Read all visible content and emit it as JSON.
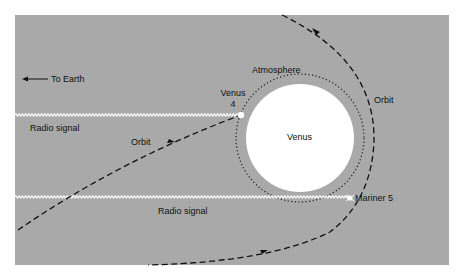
{
  "figure": {
    "title": "",
    "colors": {
      "page_background": "#ffffff",
      "panel_background": "#a9a9a9",
      "planet": "#ffffff",
      "ink": "#111111",
      "radio_signal": "#ffffff"
    }
  },
  "labels": {
    "to_earth": "To Earth",
    "radio_signal_upper": "Radio signal",
    "radio_signal_lower": "Radio signal",
    "orbit_left": "Orbit",
    "orbit_right": "Orbit",
    "atmosphere": "Atmosphere",
    "venus_planet": "Venus",
    "venus4_line1": "Venus",
    "venus4_line2": "4",
    "mariner5": "Mariner 5"
  },
  "elements": {
    "planet": {
      "name": "Venus",
      "cx": 300,
      "cy": 138,
      "r": 54
    },
    "atmosphere": {
      "cx": 300,
      "cy": 138,
      "r": 64,
      "style": "dotted"
    },
    "spacecraft": [
      {
        "name": "Venus 4",
        "x": 241,
        "y": 115
      },
      {
        "name": "Mariner 5",
        "x": 350,
        "y": 198
      }
    ],
    "radio_signals": [
      {
        "label": "Radio signal",
        "y": 115,
        "x_start": 15,
        "x_end": 241
      },
      {
        "label": "Radio signal",
        "y": 197,
        "x_start": 15,
        "x_end": 350
      }
    ],
    "orbits": [
      {
        "label": "Orbit",
        "craft": "Venus 4",
        "style": "dashed"
      },
      {
        "label": "Orbit",
        "craft": "Mariner 5",
        "style": "dashed"
      }
    ],
    "direction_arrow": {
      "label": "To Earth",
      "direction": "left"
    }
  }
}
